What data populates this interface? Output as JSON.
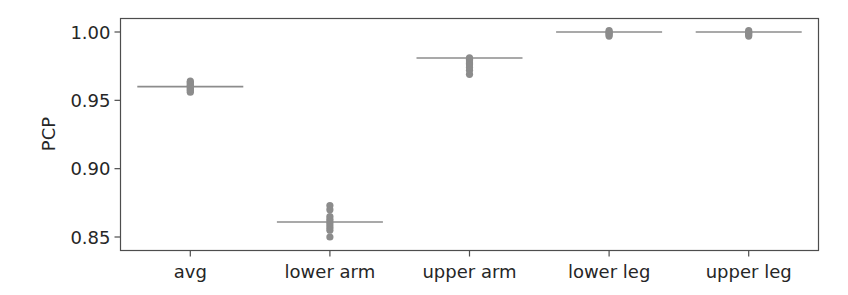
{
  "chart_data": {
    "type": "strip",
    "title": "",
    "xlabel": "",
    "ylabel": "PCP",
    "ylim": [
      0.84,
      1.008
    ],
    "yticks": [
      0.85,
      0.9,
      0.95,
      1.0
    ],
    "ytick_labels": [
      "0.85",
      "0.90",
      "0.95",
      "1.00"
    ],
    "categories": [
      "avg",
      "lower arm",
      "upper arm",
      "lower leg",
      "upper leg"
    ],
    "medians": [
      0.96,
      0.861,
      0.981,
      1.0,
      1.0
    ],
    "points": [
      [
        0.964,
        0.963,
        0.962,
        0.961,
        0.96,
        0.959,
        0.958,
        0.957,
        0.956
      ],
      [
        0.873,
        0.87,
        0.865,
        0.863,
        0.861,
        0.859,
        0.857,
        0.855,
        0.85
      ],
      [
        0.981,
        0.98,
        0.979,
        0.978,
        0.977,
        0.976,
        0.974,
        0.972,
        0.969
      ],
      [
        1.001,
        1.0,
        0.999,
        0.998,
        0.997
      ],
      [
        1.001,
        1.0,
        0.999,
        0.998,
        0.997
      ]
    ],
    "grid": false,
    "legend": null,
    "colors": {
      "points": "#8c8c8c",
      "median_line": "#8c8c8c",
      "axes": "#4d4d4d",
      "text": "#262626"
    }
  }
}
